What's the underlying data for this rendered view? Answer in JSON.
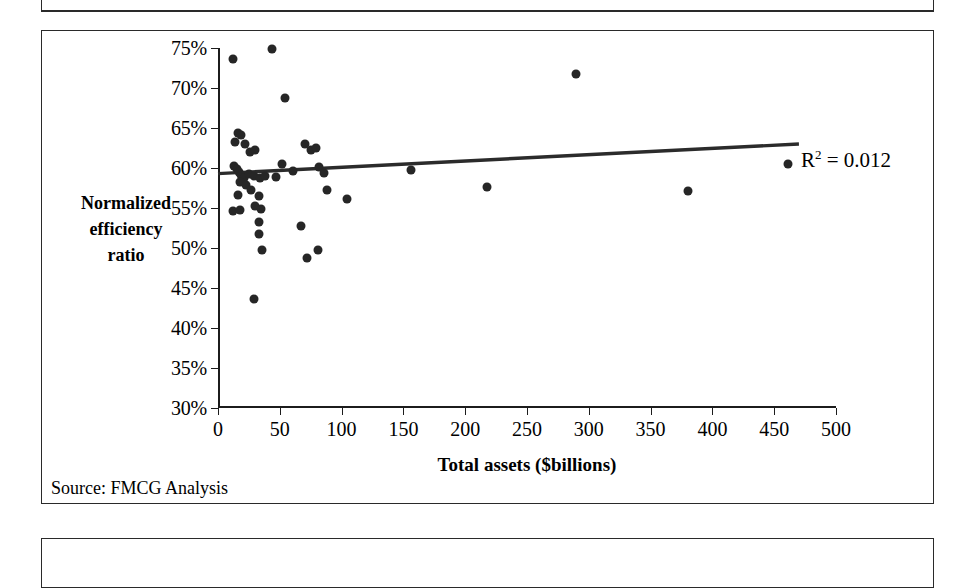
{
  "document": {
    "boxes": [
      "partial-box-above",
      "chart-box",
      "partial-box-below"
    ]
  },
  "figure": {
    "source_note": "Source: FMCG Analysis",
    "r2_prefix": "R",
    "r2_exponent": "2",
    "r2_value": " = 0.012"
  },
  "chart_data": {
    "type": "scatter",
    "title": "",
    "xlabel": "Total assets ($billions)",
    "ylabel": "Normalized efficiency ratio",
    "ylabel_lines": [
      "Normalized",
      "efficiency",
      "ratio"
    ],
    "xlim": [
      0,
      500
    ],
    "ylim": [
      30,
      75
    ],
    "xticks": [
      0,
      50,
      100,
      150,
      200,
      250,
      300,
      350,
      400,
      450,
      500
    ],
    "yticks": [
      30,
      35,
      40,
      45,
      50,
      55,
      60,
      65,
      70,
      75
    ],
    "xtick_labels": [
      "0",
      "50",
      "100",
      "150",
      "200",
      "250",
      "300",
      "350",
      "400",
      "450",
      "500"
    ],
    "ytick_labels": [
      "30%",
      "35%",
      "40%",
      "45%",
      "50%",
      "55%",
      "60%",
      "65%",
      "70%",
      "75%"
    ],
    "grid": false,
    "legend": "none",
    "annotations": [
      {
        "text": "R2 = 0.012",
        "x": 470,
        "y": 63.5,
        "note": "R-squared of linear trendline"
      }
    ],
    "trendline": {
      "type": "linear",
      "r_squared": 0.012,
      "x_start": 0,
      "y_start": 59.3,
      "x_end": 470,
      "y_end": 63.0,
      "color": "#2b2b2b"
    },
    "marker": {
      "shape": "circle",
      "color": "#262626",
      "size_px": 9
    },
    "points": [
      {
        "x": 12,
        "y": 73.6
      },
      {
        "x": 44,
        "y": 74.9
      },
      {
        "x": 54,
        "y": 68.8
      },
      {
        "x": 16,
        "y": 64.4
      },
      {
        "x": 19,
        "y": 64.1
      },
      {
        "x": 14,
        "y": 63.3
      },
      {
        "x": 22,
        "y": 63.0
      },
      {
        "x": 26,
        "y": 62.0
      },
      {
        "x": 30,
        "y": 62.2
      },
      {
        "x": 70,
        "y": 63.0
      },
      {
        "x": 75,
        "y": 62.3
      },
      {
        "x": 79,
        "y": 62.5
      },
      {
        "x": 13,
        "y": 60.3
      },
      {
        "x": 15,
        "y": 59.9
      },
      {
        "x": 17,
        "y": 59.5
      },
      {
        "x": 19,
        "y": 59.1
      },
      {
        "x": 21,
        "y": 58.8
      },
      {
        "x": 18,
        "y": 58.2
      },
      {
        "x": 23,
        "y": 57.9
      },
      {
        "x": 25,
        "y": 59.3
      },
      {
        "x": 29,
        "y": 59.0
      },
      {
        "x": 34,
        "y": 58.7
      },
      {
        "x": 38,
        "y": 59.0
      },
      {
        "x": 47,
        "y": 58.9
      },
      {
        "x": 52,
        "y": 60.5
      },
      {
        "x": 61,
        "y": 59.6
      },
      {
        "x": 82,
        "y": 60.1
      },
      {
        "x": 86,
        "y": 59.4
      },
      {
        "x": 16,
        "y": 56.6
      },
      {
        "x": 27,
        "y": 57.2
      },
      {
        "x": 33,
        "y": 56.5
      },
      {
        "x": 12,
        "y": 54.6
      },
      {
        "x": 18,
        "y": 54.8
      },
      {
        "x": 30,
        "y": 55.2
      },
      {
        "x": 35,
        "y": 54.9
      },
      {
        "x": 33,
        "y": 53.2
      },
      {
        "x": 33,
        "y": 51.8
      },
      {
        "x": 36,
        "y": 49.7
      },
      {
        "x": 67,
        "y": 52.7
      },
      {
        "x": 72,
        "y": 48.7
      },
      {
        "x": 81,
        "y": 49.8
      },
      {
        "x": 88,
        "y": 57.3
      },
      {
        "x": 104,
        "y": 56.1
      },
      {
        "x": 156,
        "y": 59.8
      },
      {
        "x": 218,
        "y": 57.6
      },
      {
        "x": 290,
        "y": 71.7
      },
      {
        "x": 380,
        "y": 57.1
      },
      {
        "x": 461,
        "y": 60.5
      },
      {
        "x": 29,
        "y": 43.6
      }
    ]
  }
}
